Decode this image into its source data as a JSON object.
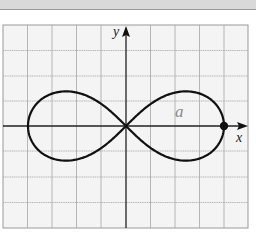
{
  "figure": {
    "type": "lemniscate-graph",
    "axis_labels": {
      "x": "x",
      "y": "y"
    },
    "curve_label": "a",
    "marked_point": "(a, 0)",
    "grid": {
      "columns": 10,
      "rows": 8,
      "cell_px": 24.5
    },
    "colors": {
      "background": "#ffffff",
      "grid_fill": "#f4f4f4",
      "grid_line": "#9a9a9a",
      "axis": "#222222",
      "curve": "#111111",
      "curve_label": "#8a8a8a",
      "top_band": "#d9d9d9"
    }
  }
}
